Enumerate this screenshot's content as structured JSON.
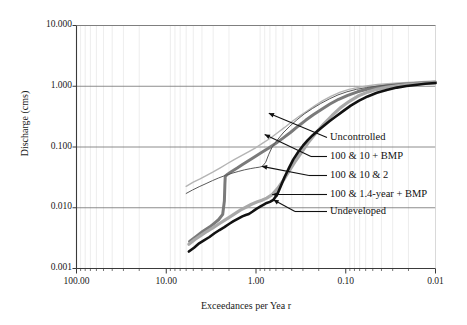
{
  "chart_data": {
    "type": "line",
    "title": "",
    "xlabel": "Exceedances per Yea r",
    "ylabel": "Discharge (cms)",
    "xscale": "log",
    "yscale": "log",
    "x_reversed": true,
    "xlim": [
      100.0,
      0.01
    ],
    "ylim": [
      0.001,
      10.0
    ],
    "xticklabels": [
      "100.00",
      "10.00",
      "1.00",
      "0.10",
      "0.01"
    ],
    "xtickvalues": [
      100.0,
      10.0,
      1.0,
      0.1,
      0.01
    ],
    "yticklabels": [
      "10.000",
      "1.000",
      "0.100",
      "0.010",
      "0.001"
    ],
    "ytickvalues": [
      10.0,
      1.0,
      0.1,
      0.01,
      0.001
    ],
    "grid": "major horizontal solid, minor vertical light",
    "legend": "inline annotated labels with leader arrows, right side",
    "series": [
      {
        "name": "Uncontrolled",
        "color": "#b4b4b4",
        "width": 1.4,
        "points": [
          [
            6.0,
            0.0225
          ],
          [
            5.0,
            0.0265
          ],
          [
            4.2,
            0.03
          ],
          [
            3.5,
            0.0345
          ],
          [
            3.0,
            0.039
          ],
          [
            2.5,
            0.0455
          ],
          [
            2.1,
            0.053
          ],
          [
            1.75,
            0.062
          ],
          [
            1.45,
            0.072
          ],
          [
            1.2,
            0.084
          ],
          [
            1.0,
            0.098
          ],
          [
            0.85,
            0.115
          ],
          [
            0.7,
            0.138
          ],
          [
            0.58,
            0.17
          ],
          [
            0.48,
            0.21
          ],
          [
            0.4,
            0.26
          ],
          [
            0.33,
            0.32
          ],
          [
            0.27,
            0.39
          ],
          [
            0.22,
            0.48
          ],
          [
            0.18,
            0.58
          ],
          [
            0.145,
            0.69
          ],
          [
            0.115,
            0.8
          ],
          [
            0.092,
            0.89
          ],
          [
            0.072,
            0.96
          ],
          [
            0.056,
            1.02
          ],
          [
            0.044,
            1.07
          ],
          [
            0.034,
            1.1
          ],
          [
            0.026,
            1.13
          ],
          [
            0.02,
            1.16
          ],
          [
            0.016,
            1.18
          ],
          [
            0.013,
            1.2
          ],
          [
            0.01,
            1.22
          ]
        ]
      },
      {
        "name": "100 & 10 + BMP",
        "color": "#7a7a7a",
        "width": 3.0,
        "points": [
          [
            5.5,
            0.0028
          ],
          [
            4.6,
            0.0034
          ],
          [
            3.9,
            0.0041
          ],
          [
            3.3,
            0.0048
          ],
          [
            2.9,
            0.0056
          ],
          [
            2.6,
            0.0064
          ],
          [
            2.35,
            0.0078
          ],
          [
            2.25,
            0.013
          ],
          [
            2.22,
            0.025
          ],
          [
            2.2,
            0.033
          ],
          [
            2.05,
            0.036
          ],
          [
            1.85,
            0.04
          ],
          [
            1.62,
            0.045
          ],
          [
            1.4,
            0.052
          ],
          [
            1.2,
            0.06
          ],
          [
            1.02,
            0.07
          ],
          [
            0.86,
            0.082
          ],
          [
            0.72,
            0.096
          ],
          [
            0.6,
            0.115
          ],
          [
            0.5,
            0.14
          ],
          [
            0.41,
            0.175
          ],
          [
            0.34,
            0.22
          ],
          [
            0.28,
            0.275
          ],
          [
            0.23,
            0.34
          ],
          [
            0.185,
            0.42
          ],
          [
            0.15,
            0.51
          ],
          [
            0.12,
            0.61
          ],
          [
            0.095,
            0.71
          ],
          [
            0.074,
            0.81
          ],
          [
            0.058,
            0.89
          ],
          [
            0.045,
            0.96
          ],
          [
            0.035,
            1.02
          ],
          [
            0.027,
            1.06
          ],
          [
            0.021,
            1.09
          ],
          [
            0.016,
            1.12
          ],
          [
            0.013,
            1.14
          ],
          [
            0.01,
            1.16
          ]
        ]
      },
      {
        "name": "100 & 10 & 2",
        "color": "#5a5a5a",
        "width": 1.0,
        "points": [
          [
            6.0,
            0.0172
          ],
          [
            5.1,
            0.0196
          ],
          [
            4.3,
            0.0222
          ],
          [
            3.6,
            0.025
          ],
          [
            3.05,
            0.028
          ],
          [
            2.6,
            0.031
          ],
          [
            2.2,
            0.034
          ],
          [
            1.85,
            0.037
          ],
          [
            1.58,
            0.0395
          ],
          [
            1.35,
            0.042
          ],
          [
            1.16,
            0.044
          ],
          [
            1.02,
            0.0455
          ],
          [
            0.92,
            0.0465
          ],
          [
            0.85,
            0.048
          ],
          [
            0.78,
            0.056
          ],
          [
            0.72,
            0.076
          ],
          [
            0.66,
            0.1
          ],
          [
            0.58,
            0.13
          ],
          [
            0.5,
            0.17
          ],
          [
            0.42,
            0.22
          ],
          [
            0.35,
            0.28
          ],
          [
            0.29,
            0.35
          ],
          [
            0.235,
            0.43
          ],
          [
            0.19,
            0.52
          ],
          [
            0.152,
            0.62
          ],
          [
            0.122,
            0.72
          ],
          [
            0.097,
            0.81
          ],
          [
            0.076,
            0.89
          ],
          [
            0.059,
            0.95
          ],
          [
            0.046,
            1.0
          ],
          [
            0.036,
            1.04
          ],
          [
            0.028,
            1.07
          ],
          [
            0.021,
            1.1
          ],
          [
            0.016,
            1.12
          ],
          [
            0.013,
            1.14
          ],
          [
            0.01,
            1.15
          ]
        ]
      },
      {
        "name": "100 & 1.4-year + BMP",
        "color": "#a8a8a8",
        "width": 3.2,
        "points": [
          [
            5.6,
            0.0025
          ],
          [
            4.8,
            0.003
          ],
          [
            4.1,
            0.0035
          ],
          [
            3.5,
            0.0041
          ],
          [
            3.0,
            0.0047
          ],
          [
            2.6,
            0.0054
          ],
          [
            2.25,
            0.0062
          ],
          [
            1.95,
            0.0071
          ],
          [
            1.7,
            0.0081
          ],
          [
            1.48,
            0.0092
          ],
          [
            1.28,
            0.0103
          ],
          [
            1.12,
            0.0114
          ],
          [
            0.98,
            0.0124
          ],
          [
            0.86,
            0.0133
          ],
          [
            0.76,
            0.0144
          ],
          [
            0.66,
            0.0165
          ],
          [
            0.57,
            0.021
          ],
          [
            0.49,
            0.029
          ],
          [
            0.42,
            0.042
          ],
          [
            0.36,
            0.06
          ],
          [
            0.305,
            0.085
          ],
          [
            0.26,
            0.12
          ],
          [
            0.215,
            0.17
          ],
          [
            0.175,
            0.24
          ],
          [
            0.142,
            0.33
          ],
          [
            0.115,
            0.44
          ],
          [
            0.092,
            0.56
          ],
          [
            0.073,
            0.69
          ],
          [
            0.057,
            0.8
          ],
          [
            0.045,
            0.89
          ],
          [
            0.035,
            0.96
          ],
          [
            0.027,
            1.02
          ],
          [
            0.021,
            1.06
          ],
          [
            0.016,
            1.1
          ],
          [
            0.013,
            1.12
          ],
          [
            0.01,
            1.14
          ]
        ]
      },
      {
        "name": "Undeveloped",
        "color": "#111111",
        "width": 2.6,
        "points": [
          [
            5.6,
            0.0019
          ],
          [
            4.9,
            0.0022
          ],
          [
            4.3,
            0.0026
          ],
          [
            3.8,
            0.0029
          ],
          [
            3.3,
            0.0033
          ],
          [
            2.9,
            0.0038
          ],
          [
            2.55,
            0.0043
          ],
          [
            2.25,
            0.0048
          ],
          [
            2.0,
            0.0054
          ],
          [
            1.78,
            0.006
          ],
          [
            1.58,
            0.0066
          ],
          [
            1.42,
            0.0072
          ],
          [
            1.3,
            0.0076
          ],
          [
            1.2,
            0.0079
          ],
          [
            1.1,
            0.0086
          ],
          [
            1.0,
            0.0095
          ],
          [
            0.9,
            0.0104
          ],
          [
            0.82,
            0.0113
          ],
          [
            0.76,
            0.012
          ],
          [
            0.7,
            0.0125
          ],
          [
            0.64,
            0.0135
          ],
          [
            0.58,
            0.0165
          ],
          [
            0.53,
            0.0225
          ],
          [
            0.48,
            0.032
          ],
          [
            0.43,
            0.045
          ],
          [
            0.385,
            0.062
          ],
          [
            0.34,
            0.082
          ],
          [
            0.3,
            0.105
          ],
          [
            0.265,
            0.13
          ],
          [
            0.235,
            0.155
          ],
          [
            0.205,
            0.185
          ],
          [
            0.178,
            0.22
          ],
          [
            0.152,
            0.265
          ],
          [
            0.128,
            0.32
          ],
          [
            0.107,
            0.39
          ],
          [
            0.088,
            0.48
          ],
          [
            0.071,
            0.58
          ],
          [
            0.057,
            0.68
          ],
          [
            0.045,
            0.78
          ],
          [
            0.035,
            0.87
          ],
          [
            0.027,
            0.95
          ],
          [
            0.021,
            1.01
          ],
          [
            0.016,
            1.06
          ],
          [
            0.013,
            1.1
          ],
          [
            0.01,
            1.13
          ]
        ]
      }
    ],
    "annotations": [
      {
        "label": "Uncontrolled",
        "target_x": 0.72,
        "target_y": 0.36
      },
      {
        "label": "100 & 10 + BMP",
        "target_x": 0.8,
        "target_y": 0.16
      },
      {
        "label": "100 & 10 & 2",
        "target_x": 0.86,
        "target_y": 0.048
      },
      {
        "label": "100 & 1.4-year + BMP",
        "target_x": 0.66,
        "target_y": 0.0165
      },
      {
        "label": "Undeveloped",
        "target_x": 0.64,
        "target_y": 0.0135
      }
    ]
  }
}
